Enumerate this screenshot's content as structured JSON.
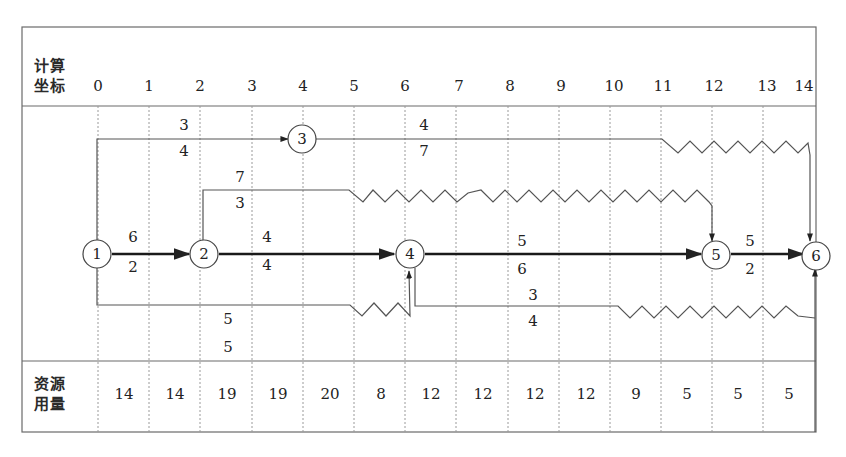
{
  "header": {
    "row_label_line1": "计算",
    "row_label_line2": "坐标",
    "time_ticks": [
      "0",
      "1",
      "2",
      "3",
      "4",
      "5",
      "6",
      "7",
      "8",
      "9",
      "10",
      "11",
      "12",
      "13",
      "14"
    ]
  },
  "resource_row": {
    "label_line1": "资源",
    "label_line2": "用量",
    "values": [
      "14",
      "14",
      "19",
      "19",
      "20",
      "8",
      "12",
      "12",
      "12",
      "12",
      "9",
      "5",
      "5",
      "5"
    ]
  },
  "nodes": [
    {
      "id": "1",
      "label": "1",
      "t": 0
    },
    {
      "id": "2",
      "label": "2",
      "t": 2
    },
    {
      "id": "3",
      "label": "3",
      "t": 4
    },
    {
      "id": "4",
      "label": "4",
      "t": 6
    },
    {
      "id": "5",
      "label": "5",
      "t": 12
    },
    {
      "id": "6",
      "label": "6",
      "t": 14
    }
  ],
  "activities": [
    {
      "from": "1",
      "to": "2",
      "top": "6",
      "bottom": "2",
      "critical": true
    },
    {
      "from": "1",
      "to": "3",
      "top": "3",
      "bottom": "4",
      "critical": false
    },
    {
      "from": "1",
      "to": "4",
      "top": "5",
      "bottom": "5",
      "critical": false
    },
    {
      "from": "2",
      "to": "4",
      "top": "4",
      "bottom": "4",
      "critical": true
    },
    {
      "from": "2",
      "to": "5",
      "top": "7",
      "bottom": "3",
      "critical": false
    },
    {
      "from": "3",
      "to": "6",
      "top": "4",
      "bottom": "7",
      "critical": false
    },
    {
      "from": "4",
      "to": "5",
      "top": "5",
      "bottom": "6",
      "critical": true
    },
    {
      "from": "4",
      "to": "6",
      "top": "3",
      "bottom": "4",
      "critical": false
    },
    {
      "from": "5",
      "to": "6",
      "top": "5",
      "bottom": "2",
      "critical": true
    }
  ],
  "colors": {
    "line": "#555555",
    "critical": "#1a1a1a",
    "grid": "#9a9a9a",
    "frame": "#6a6a6a"
  }
}
